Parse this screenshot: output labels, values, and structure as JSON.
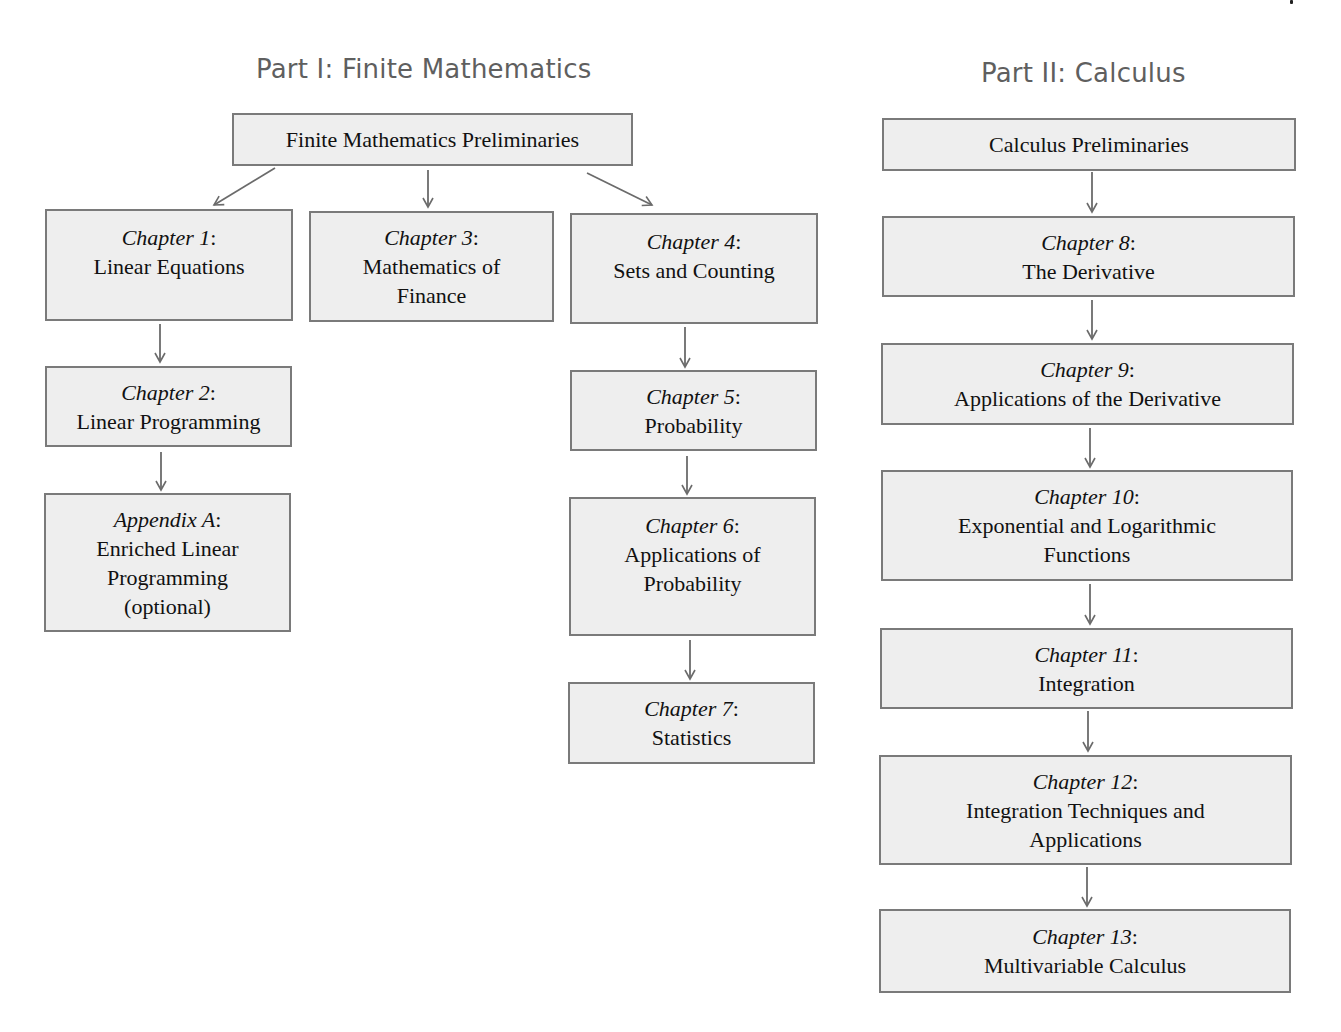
{
  "part1": {
    "title": "Part I: Finite Mathematics",
    "preliminaries": "Finite Mathematics Preliminaries",
    "nodes": [
      {
        "id": "ch1",
        "label": "Chapter 1",
        "colon": ":",
        "title_lines": [
          "Linear Equations"
        ]
      },
      {
        "id": "ch2",
        "label": "Chapter 2",
        "colon": ":",
        "title_lines": [
          "Linear Programming"
        ]
      },
      {
        "id": "appA",
        "label": "Appendix A",
        "colon": ":",
        "title_lines": [
          "Enriched Linear",
          "Programming",
          "(optional)"
        ]
      },
      {
        "id": "ch3",
        "label": "Chapter 3",
        "colon": ":",
        "title_lines": [
          "Mathematics of",
          "Finance"
        ]
      },
      {
        "id": "ch4",
        "label": "Chapter 4",
        "colon": ":",
        "title_lines": [
          "Sets and Counting"
        ]
      },
      {
        "id": "ch5",
        "label": "Chapter 5",
        "colon": ":",
        "title_lines": [
          "Probability"
        ]
      },
      {
        "id": "ch6",
        "label": "Chapter 6",
        "colon": ":",
        "title_lines": [
          "Applications of",
          "Probability"
        ]
      },
      {
        "id": "ch7",
        "label": "Chapter 7",
        "colon": ":",
        "title_lines": [
          "Statistics"
        ]
      }
    ]
  },
  "part2": {
    "title": "Part II: Calculus",
    "preliminaries": "Calculus Preliminaries",
    "nodes": [
      {
        "id": "ch8",
        "label": "Chapter 8",
        "colon": ":",
        "title_lines": [
          "The Derivative"
        ]
      },
      {
        "id": "ch9",
        "label": "Chapter 9",
        "colon": ":",
        "title_lines": [
          "Applications of the Derivative"
        ]
      },
      {
        "id": "ch10",
        "label": "Chapter 10",
        "colon": ":",
        "title_lines": [
          "Exponential and Logarithmic",
          "Functions"
        ]
      },
      {
        "id": "ch11",
        "label": "Chapter 11",
        "colon": ":",
        "title_lines": [
          "Integration"
        ]
      },
      {
        "id": "ch12",
        "label": "Chapter 12",
        "colon": ":",
        "title_lines": [
          "Integration Techniques and",
          "Applications"
        ]
      },
      {
        "id": "ch13",
        "label": "Chapter 13",
        "colon": ":",
        "title_lines": [
          "Multivariable Calculus"
        ]
      }
    ]
  },
  "edges": [
    [
      "Finite Mathematics Preliminaries",
      "Chapter 1"
    ],
    [
      "Finite Mathematics Preliminaries",
      "Chapter 3"
    ],
    [
      "Finite Mathematics Preliminaries",
      "Chapter 4"
    ],
    [
      "Chapter 1",
      "Chapter 2"
    ],
    [
      "Chapter 2",
      "Appendix A"
    ],
    [
      "Chapter 4",
      "Chapter 5"
    ],
    [
      "Chapter 5",
      "Chapter 6"
    ],
    [
      "Chapter 6",
      "Chapter 7"
    ],
    [
      "Calculus Preliminaries",
      "Chapter 8"
    ],
    [
      "Chapter 8",
      "Chapter 9"
    ],
    [
      "Chapter 9",
      "Chapter 10"
    ],
    [
      "Chapter 10",
      "Chapter 11"
    ],
    [
      "Chapter 11",
      "Chapter 12"
    ],
    [
      "Chapter 12",
      "Chapter 13"
    ]
  ],
  "colors": {
    "box_fill": "#eeeeee",
    "box_border": "#7a7a7a",
    "arrow": "#6b6b6b",
    "part_title": "#5f5f5f"
  }
}
